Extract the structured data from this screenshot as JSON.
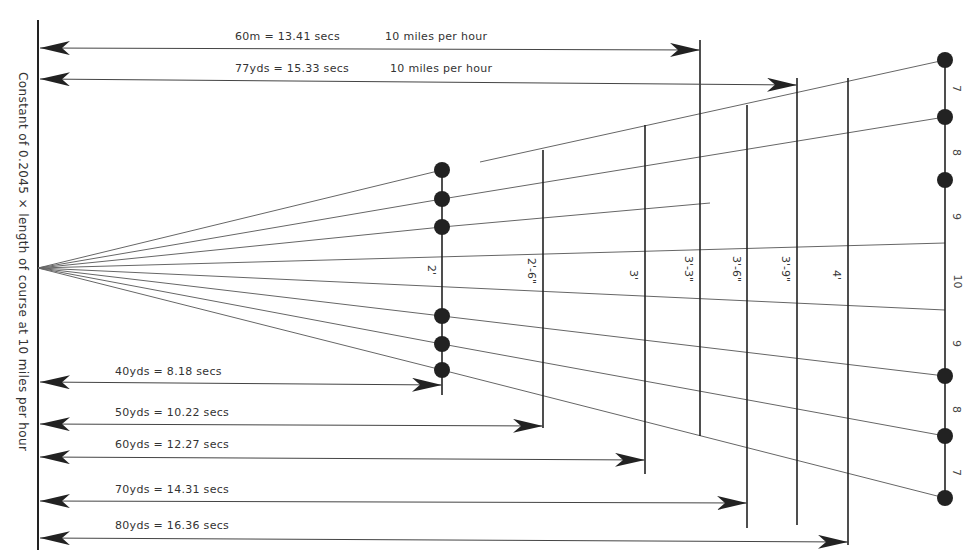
{
  "diagram": {
    "side_label": "Constant of 0.2045 × length of course at 10 miles per hour",
    "top_arrows": [
      {
        "label": "60m = 13.41 secs",
        "speed": "10 miles per hour",
        "y": 50,
        "x_end": 700
      },
      {
        "label": "77yds = 15.33 secs",
        "speed": "10 miles per hour",
        "y": 85,
        "x_end": 797
      }
    ],
    "bottom_arrows": [
      {
        "label": "40yds = 8.18 secs",
        "y": 385,
        "x_end": 442
      },
      {
        "label": "50yds = 10.22 secs",
        "y": 426,
        "x_end": 543
      },
      {
        "label": "60yds = 12.27 secs",
        "y": 460,
        "x_end": 645
      },
      {
        "label": "70yds = 14.31 secs",
        "y": 503,
        "x_end": 747
      },
      {
        "label": "80yds = 16.36 secs",
        "y": 540,
        "x_end": 848
      }
    ],
    "hurdle_heights": [
      {
        "label": "2'",
        "x": 442
      },
      {
        "label": "2'-6\"",
        "x": 543
      },
      {
        "label": "3'",
        "x": 645
      },
      {
        "label": "3'-3\"",
        "x": 700
      },
      {
        "label": "3'-6\"",
        "x": 747
      },
      {
        "label": "3'-9\"",
        "x": 797
      },
      {
        "label": "4'",
        "x": 848
      }
    ],
    "right_scale_numbers": [
      "7",
      "8",
      "9",
      "10",
      "9",
      "8",
      "7"
    ],
    "colors": {
      "ink": "#222222",
      "line": "#555555",
      "background": "#ffffff"
    }
  }
}
